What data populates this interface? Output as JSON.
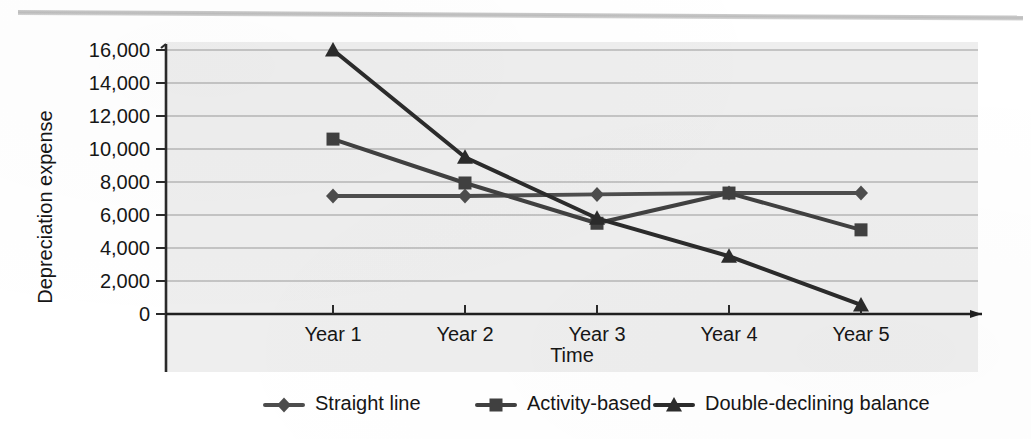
{
  "figure": {
    "background_color": "#ffffff",
    "plot_background_color": "#eeeeee",
    "top_rule": "horizontal-rule"
  },
  "chart_data": {
    "type": "line",
    "title": "",
    "xlabel": "Time",
    "ylabel": "Depreciation expense",
    "categories": [
      "Year 1",
      "Year 2",
      "Year 3",
      "Year 4",
      "Year 5"
    ],
    "ylim": [
      0,
      16000
    ],
    "yticks": [
      0,
      2000,
      4000,
      6000,
      8000,
      10000,
      12000,
      14000,
      16000
    ],
    "ytick_labels": [
      "0",
      "2,000",
      "4,000",
      "6,000",
      "8,000",
      "10,000",
      "12,000",
      "14,000",
      "16,000"
    ],
    "grid": true,
    "grid_axis": "y",
    "legend_position": "bottom",
    "series": [
      {
        "name": "Straight line",
        "marker": "diamond",
        "color": "#4d4d4d",
        "values": [
          7150,
          7150,
          7250,
          7330,
          7330
        ]
      },
      {
        "name": "Activity-based",
        "marker": "square",
        "color": "#404040",
        "values": [
          10600,
          7940,
          5500,
          7330,
          5100
        ]
      },
      {
        "name": "Double-declining balance",
        "marker": "triangle",
        "color": "#2b2b2b",
        "values": [
          16000,
          9500,
          5800,
          3500,
          550
        ]
      }
    ]
  },
  "legend": {
    "items": [
      {
        "label": "Straight line",
        "marker": "diamond-marker-icon"
      },
      {
        "label": "Activity-based",
        "marker": "square-marker-icon"
      },
      {
        "label": "Double-declining balance",
        "marker": "triangle-marker-icon"
      }
    ]
  },
  "axis_ticks": {
    "y": [
      "16,000",
      "14,000",
      "12,000",
      "10,000",
      "8,000",
      "6,000",
      "4,000",
      "2,000",
      "0"
    ],
    "x": [
      "Year 1",
      "Year 2",
      "Year 3",
      "Year 4",
      "Year 5"
    ]
  },
  "labels": {
    "y_axis_title": "Depreciation expense",
    "x_axis_title": "Time"
  }
}
